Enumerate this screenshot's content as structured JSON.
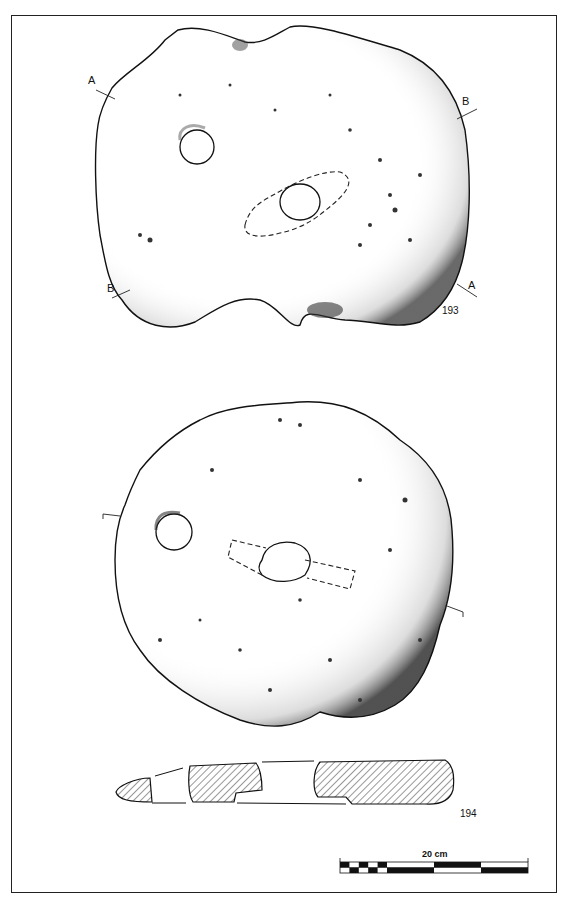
{
  "plate": {
    "objects": [
      {
        "catalogue_number": "193",
        "section_markers": [
          "A",
          "B",
          "B",
          "A"
        ],
        "view": "plan"
      },
      {
        "catalogue_number": "194",
        "view": "plan and section"
      }
    ],
    "scale_bar": {
      "label": "20 cm",
      "colors": {
        "dark": "#111111",
        "light": "#ffffff"
      }
    }
  },
  "colors": {
    "ink": "#111111",
    "paper": "#ffffff",
    "hatch": "#333333"
  }
}
